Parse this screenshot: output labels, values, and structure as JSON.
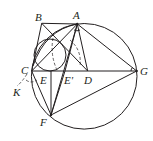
{
  "diagram": {
    "type": "geometry",
    "labels": {
      "A": "A",
      "B": "B",
      "C": "C",
      "D": "D",
      "E": "E",
      "E_prime": "E'",
      "F": "F",
      "G": "G",
      "K": "K"
    },
    "stroke_color": "#231f20",
    "background": "#ffffff"
  }
}
